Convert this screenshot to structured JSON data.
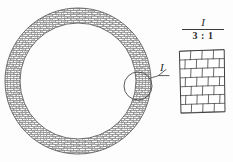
{
  "drawing": {
    "title": "Annular brick-hatched ring with enlarged detail",
    "background_color": "#fdfdfd",
    "line_color": "#6f6f6f",
    "dark_line_color": "#3a3a3a",
    "text_color": "#2b2b2b"
  },
  "ring": {
    "name": "annular-ring",
    "center_x": 78,
    "center_y": 81,
    "outer_radius": 73,
    "inner_radius": 58,
    "hatch_pattern": "running-bond-brick",
    "hatch_color": "#7d7d7d"
  },
  "detail_marker": {
    "label": "I",
    "circle_center_x": 138,
    "circle_center_y": 86,
    "circle_radius": 14,
    "leader_color": "#4a4a4a"
  },
  "detail_view": {
    "label": "I",
    "scale": "3 : 1",
    "patch": {
      "name": "brick-hatch-patch",
      "left": 179,
      "top": 50,
      "width": 46,
      "height": 63,
      "rows": 7,
      "columns": 4,
      "pattern": "running-bond-brick"
    }
  }
}
